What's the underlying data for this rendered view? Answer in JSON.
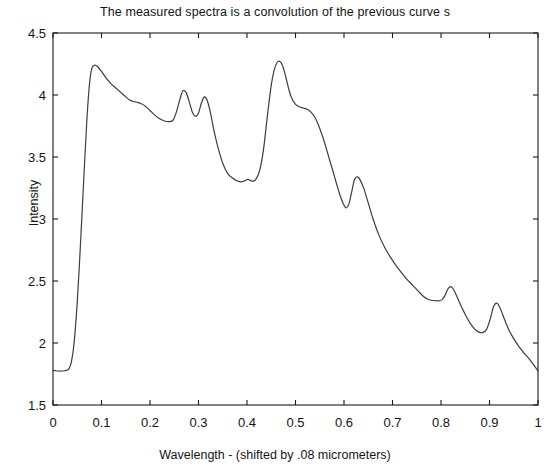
{
  "chart_data": {
    "type": "line",
    "title": "The measured spectra is a convolution of the previous curve s",
    "xlabel": "Wavelength - (shifted by .08 micrometers)",
    "ylabel": "Intensity",
    "xlim": [
      0,
      1
    ],
    "ylim": [
      1.5,
      4.5
    ],
    "xticks": [
      "0",
      "0.1",
      "0.2",
      "0.3",
      "0.4",
      "0.5",
      "0.6",
      "0.7",
      "0.8",
      "0.9",
      "1"
    ],
    "xtick_values": [
      0,
      0.1,
      0.2,
      0.3,
      0.4,
      0.5,
      0.6,
      0.7,
      0.8,
      0.9,
      1
    ],
    "yticks": [
      "1.5",
      "2",
      "2.5",
      "3",
      "3.5",
      "4",
      "4.5"
    ],
    "ytick_values": [
      1.5,
      2,
      2.5,
      3,
      3.5,
      4,
      4.5
    ],
    "grid": false,
    "legend": null,
    "line_color": "#3d3d3d",
    "line_width": 1.2,
    "series": [
      {
        "name": "measured spectra",
        "x": [
          0.0,
          0.006,
          0.012,
          0.018,
          0.024,
          0.03,
          0.034,
          0.038,
          0.042,
          0.046,
          0.05,
          0.054,
          0.058,
          0.062,
          0.066,
          0.07,
          0.075,
          0.08,
          0.086,
          0.092,
          0.1,
          0.11,
          0.12,
          0.13,
          0.14,
          0.15,
          0.158,
          0.166,
          0.174,
          0.182,
          0.19,
          0.2,
          0.21,
          0.22,
          0.23,
          0.24,
          0.248,
          0.255,
          0.262,
          0.268,
          0.275,
          0.282,
          0.288,
          0.294,
          0.3,
          0.306,
          0.312,
          0.318,
          0.325,
          0.332,
          0.34,
          0.35,
          0.36,
          0.37,
          0.378,
          0.386,
          0.394,
          0.402,
          0.41,
          0.418,
          0.426,
          0.434,
          0.442,
          0.45,
          0.456,
          0.462,
          0.468,
          0.474,
          0.48,
          0.486,
          0.492,
          0.5,
          0.508,
          0.516,
          0.524,
          0.532,
          0.54,
          0.55,
          0.56,
          0.57,
          0.578,
          0.586,
          0.592,
          0.598,
          0.604,
          0.61,
          0.616,
          0.622,
          0.63,
          0.64,
          0.65,
          0.66,
          0.672,
          0.684,
          0.696,
          0.708,
          0.718,
          0.728,
          0.738,
          0.748,
          0.756,
          0.764,
          0.772,
          0.78,
          0.788,
          0.795,
          0.802,
          0.808,
          0.815,
          0.822,
          0.83,
          0.84,
          0.85,
          0.86,
          0.87,
          0.878,
          0.886,
          0.894,
          0.902,
          0.908,
          0.915,
          0.922,
          0.93,
          0.94,
          0.95,
          0.96,
          0.97,
          0.98,
          0.99,
          1.0
        ],
        "y": [
          1.78,
          1.776,
          1.774,
          1.774,
          1.776,
          1.782,
          1.8,
          1.85,
          1.95,
          2.11,
          2.33,
          2.6,
          2.9,
          3.21,
          3.52,
          3.81,
          4.08,
          4.215,
          4.24,
          4.228,
          4.19,
          4.135,
          4.09,
          4.055,
          4.02,
          3.985,
          3.96,
          3.948,
          3.94,
          3.93,
          3.912,
          3.875,
          3.838,
          3.808,
          3.79,
          3.785,
          3.8,
          3.87,
          3.97,
          4.035,
          4.015,
          3.93,
          3.855,
          3.828,
          3.855,
          3.935,
          3.985,
          3.955,
          3.85,
          3.71,
          3.58,
          3.45,
          3.368,
          3.33,
          3.31,
          3.3,
          3.305,
          3.32,
          3.305,
          3.318,
          3.39,
          3.56,
          3.83,
          4.08,
          4.2,
          4.262,
          4.27,
          4.23,
          4.145,
          4.05,
          3.975,
          3.925,
          3.905,
          3.895,
          3.885,
          3.862,
          3.82,
          3.73,
          3.615,
          3.48,
          3.375,
          3.265,
          3.19,
          3.128,
          3.09,
          3.12,
          3.22,
          3.32,
          3.335,
          3.255,
          3.13,
          3.0,
          2.87,
          2.77,
          2.69,
          2.62,
          2.57,
          2.522,
          2.48,
          2.44,
          2.405,
          2.375,
          2.355,
          2.345,
          2.342,
          2.34,
          2.35,
          2.382,
          2.44,
          2.452,
          2.4,
          2.31,
          2.23,
          2.16,
          2.11,
          2.088,
          2.085,
          2.11,
          2.2,
          2.29,
          2.322,
          2.28,
          2.2,
          2.105,
          2.035,
          1.975,
          1.925,
          1.88,
          1.83,
          1.775
        ]
      }
    ],
    "annotations": []
  },
  "plot_geometry": {
    "left": 53,
    "right": 538,
    "top": 33,
    "bottom": 405
  }
}
